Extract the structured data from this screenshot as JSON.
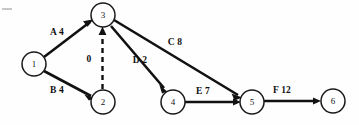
{
  "diagram": {
    "type": "activity-on-arrow-network",
    "corner_mark": "—",
    "nodes": [
      {
        "id": "1",
        "label": "1",
        "cx": 34,
        "cy": 64,
        "r": 12
      },
      {
        "id": "2",
        "label": "2",
        "cx": 103,
        "cy": 102,
        "r": 12
      },
      {
        "id": "3",
        "label": "3",
        "cx": 103,
        "cy": 15,
        "r": 12
      },
      {
        "id": "4",
        "label": "4",
        "cx": 173,
        "cy": 102,
        "r": 12
      },
      {
        "id": "5",
        "label": "5",
        "cx": 252,
        "cy": 102,
        "r": 12
      },
      {
        "id": "6",
        "label": "6",
        "cx": 333,
        "cy": 101,
        "r": 12
      }
    ],
    "edges": [
      {
        "id": "edge-a",
        "activity": "A",
        "duration": "4",
        "label": "A 4",
        "from": "1",
        "to": "3",
        "style": "solid",
        "label_x": 50,
        "label_y": 32
      },
      {
        "id": "edge-b",
        "activity": "B",
        "duration": "4",
        "label": "B 4",
        "from": "1",
        "to": "2",
        "style": "solid",
        "label_x": 50,
        "label_y": 90
      },
      {
        "id": "edge-dummy",
        "activity": "dummy",
        "duration": "0",
        "label": "0",
        "from": "2",
        "to": "3",
        "style": "dashed",
        "label_x": 89,
        "label_y": 59
      },
      {
        "id": "edge-c",
        "activity": "C",
        "duration": "8",
        "label": "C 8",
        "from": "3",
        "to": "5",
        "style": "solid",
        "label_x": 175,
        "label_y": 42
      },
      {
        "id": "edge-d",
        "activity": "D",
        "duration": "2",
        "label": "D 2",
        "from": "3",
        "to": "4",
        "style": "solid",
        "label_x": 140,
        "label_y": 60
      },
      {
        "id": "edge-e",
        "activity": "E",
        "duration": "7",
        "label": "E 7",
        "from": "4",
        "to": "5",
        "style": "solid",
        "label_x": 203,
        "label_y": 91
      },
      {
        "id": "edge-f",
        "activity": "F",
        "duration": "12",
        "label": "F 12",
        "from": "5",
        "to": "6",
        "style": "solid",
        "label_x": 282,
        "label_y": 90
      }
    ],
    "colors": {
      "background": "#fefefe",
      "stroke": "#111111",
      "node_fill": "#ffffff",
      "text": "#101010",
      "corner_tick": "#b9b9b9"
    }
  }
}
